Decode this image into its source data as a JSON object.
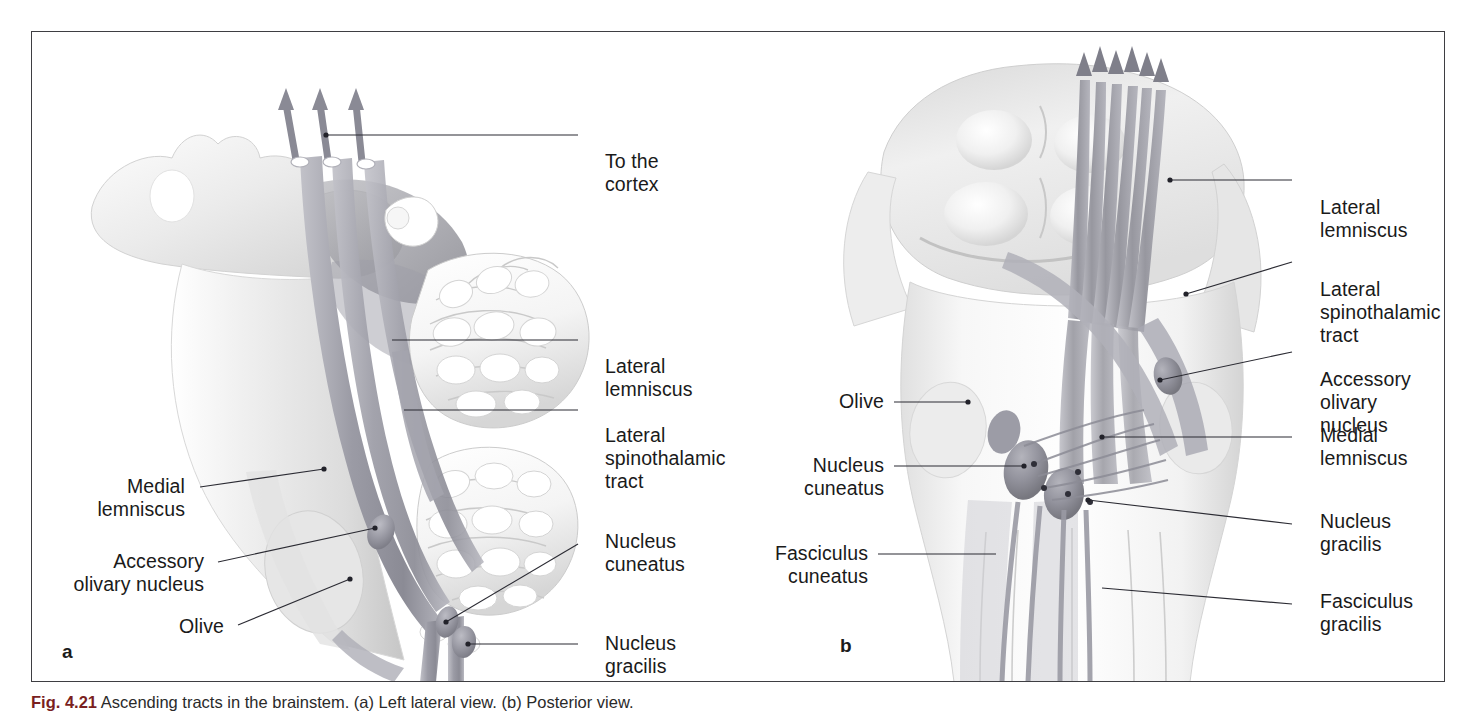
{
  "figure": {
    "caption_prefix": "Fig. 4.21",
    "caption_text": "Ascending tracts in the brainstem. (a) Left lateral view. (b) Posterior view.",
    "frame_color": "#3e3e42",
    "label_color": "#1a1a1a",
    "leader_color": "#2b2b33",
    "tract_color": "#9a9aa4",
    "nucleus_color": "#9d9da7"
  },
  "panel_a": {
    "letter": "a",
    "view": "Left lateral view",
    "labels": [
      {
        "id": "to-the-cortex",
        "text": "To the\ncortex"
      },
      {
        "id": "lateral-lemniscus",
        "text": "Lateral\nlemniscus"
      },
      {
        "id": "lateral-spinothalamic-tract",
        "text": "Lateral\nspinothalamic\ntract"
      },
      {
        "id": "medial-lemniscus",
        "text": "Medial\nlemniscus"
      },
      {
        "id": "accessory-olivary-nucleus",
        "text": "Accessory\nolivary nucleus"
      },
      {
        "id": "olive",
        "text": "Olive"
      },
      {
        "id": "nucleus-cuneatus",
        "text": "Nucleus\ncuneatus"
      },
      {
        "id": "nucleus-gracilis",
        "text": "Nucleus\ngracilis"
      }
    ]
  },
  "panel_b": {
    "letter": "b",
    "view": "Posterior view",
    "labels": [
      {
        "id": "lateral-lemniscus",
        "text": "Lateral\nlemniscus"
      },
      {
        "id": "lateral-spinothalamic-tract",
        "text": "Lateral\nspinothalamic\ntract"
      },
      {
        "id": "accessory-olivary-nucleus",
        "text": "Accessory\nolivary nucleus"
      },
      {
        "id": "medial-lemniscus",
        "text": "Medial\nlemniscus"
      },
      {
        "id": "olive",
        "text": "Olive"
      },
      {
        "id": "nucleus-cuneatus",
        "text": "Nucleus\ncuneatus"
      },
      {
        "id": "nucleus-gracilis",
        "text": "Nucleus\ngracilis"
      },
      {
        "id": "fasciculus-cuneatus",
        "text": "Fasciculus\ncuneatus"
      },
      {
        "id": "fasciculus-gracilis",
        "text": "Fasciculus\ngracilis"
      }
    ]
  }
}
